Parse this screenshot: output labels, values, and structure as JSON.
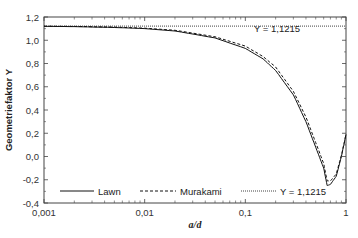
{
  "chart_data": {
    "type": "line",
    "title": "",
    "xlabel": "a/d",
    "ylabel": "Geometriefaktor Y",
    "xscale": "log",
    "xlim": [
      0.001,
      1
    ],
    "ylim": [
      -0.4,
      1.2
    ],
    "xticks": [
      "0,001",
      "0,01",
      "0,1",
      "1"
    ],
    "yticks": [
      "-0,4",
      "-0,2",
      "0,0",
      "0,2",
      "0,4",
      "0,6",
      "0,8",
      "1,0",
      "1,2"
    ],
    "grid": false,
    "legend_position": "bottom inside",
    "annotation": "Y = 1,1215",
    "series": [
      {
        "name": "Lawn",
        "style": "solid",
        "x": [
          0.001,
          0.002,
          0.005,
          0.01,
          0.02,
          0.05,
          0.1,
          0.15,
          0.2,
          0.3,
          0.4,
          0.5,
          0.6,
          0.65,
          0.7,
          0.8,
          0.9,
          1.0
        ],
        "y": [
          1.12,
          1.117,
          1.11,
          1.1,
          1.08,
          1.02,
          0.93,
          0.84,
          0.74,
          0.53,
          0.3,
          0.08,
          -0.1,
          -0.25,
          -0.24,
          -0.17,
          0.0,
          0.19
        ]
      },
      {
        "name": "Murakami",
        "style": "dashed",
        "x": [
          0.001,
          0.002,
          0.005,
          0.01,
          0.02,
          0.05,
          0.1,
          0.15,
          0.2,
          0.3,
          0.4,
          0.5,
          0.6,
          0.65,
          0.7,
          0.8,
          0.9,
          1.0
        ],
        "y": [
          1.121,
          1.119,
          1.113,
          1.104,
          1.086,
          1.03,
          0.95,
          0.86,
          0.77,
          0.56,
          0.34,
          0.12,
          -0.06,
          -0.21,
          -0.21,
          -0.15,
          0.01,
          0.19
        ]
      },
      {
        "name": "Y = 1,1215",
        "style": "dotted",
        "x": [
          0.001,
          1.0
        ],
        "y": [
          1.1215,
          1.1215
        ]
      }
    ]
  },
  "legend": {
    "items": [
      "Lawn",
      "Murakami",
      "Y = 1,1215"
    ]
  }
}
